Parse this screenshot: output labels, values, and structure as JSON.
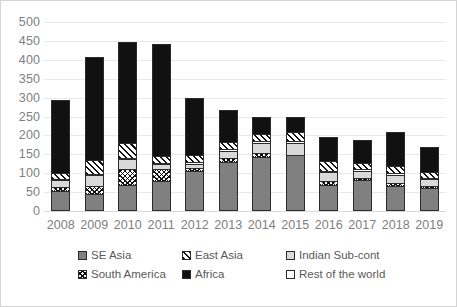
{
  "chart_data": {
    "type": "bar",
    "subtype": "stacked-bar",
    "title": "",
    "xlabel": "",
    "ylabel": "",
    "ylim": [
      0,
      500
    ],
    "ytick_step": 50,
    "yticks": [
      500,
      450,
      400,
      350,
      300,
      250,
      200,
      150,
      100,
      50,
      0
    ],
    "grid": true,
    "legend_position": "bottom",
    "categories": [
      "2008",
      "2009",
      "2010",
      "2011",
      "2012",
      "2013",
      "2014",
      "2015",
      "2016",
      "2017",
      "2018",
      "2019"
    ],
    "series": [
      {
        "name": "SE Asia",
        "pattern": "solid-gray",
        "color": "#808080",
        "values": [
          52,
          45,
          70,
          80,
          105,
          130,
          143,
          148,
          70,
          82,
          67,
          62
        ]
      },
      {
        "name": "South America",
        "pattern": "cross-hatch",
        "color": "#ffffff",
        "values": [
          12,
          22,
          42,
          32,
          8,
          10,
          10,
          0,
          10,
          5,
          7,
          5
        ]
      },
      {
        "name": "Indian Sub-cont",
        "pattern": "light-gray",
        "color": "#d9d9d9",
        "values": [
          18,
          28,
          25,
          12,
          12,
          20,
          28,
          32,
          23,
          20,
          22,
          17
        ]
      },
      {
        "name": "Rest of the world",
        "pattern": "white",
        "color": "#ffffff",
        "values": [
          4,
          4,
          4,
          4,
          4,
          4,
          4,
          5,
          4,
          4,
          4,
          4
        ]
      },
      {
        "name": "East Asia",
        "pattern": "diagonal",
        "color": "#ffffff",
        "values": [
          15,
          35,
          40,
          18,
          18,
          20,
          20,
          25,
          25,
          17,
          20,
          15
        ]
      },
      {
        "name": "Africa",
        "pattern": "solid-black",
        "color": "#111111",
        "values": [
          192,
          273,
          266,
          297,
          153,
          83,
          43,
          40,
          65,
          59,
          88,
          67
        ]
      }
    ],
    "totals": [
      293,
      407,
      447,
      443,
      300,
      267,
      248,
      250,
      197,
      187,
      208,
      170
    ],
    "legend_entries": [
      {
        "label": "SE Asia",
        "swatch": "solid-gray"
      },
      {
        "label": "East Asia",
        "swatch": "diagonal"
      },
      {
        "label": "Indian Sub-cont",
        "swatch": "light-gray"
      },
      {
        "label": "South America",
        "swatch": "cross-hatch"
      },
      {
        "label": "Africa",
        "swatch": "solid-black"
      },
      {
        "label": "Rest of the world",
        "swatch": "white"
      }
    ]
  }
}
